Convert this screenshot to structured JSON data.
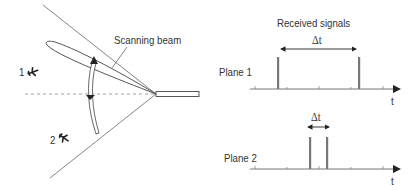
{
  "radar_diagram": {
    "beam_label": "Scanning beam",
    "aircraft": [
      {
        "label": "1",
        "icon": "airplane-icon"
      },
      {
        "label": "2",
        "icon": "airplane-icon"
      }
    ]
  },
  "signals": {
    "title": "Received signals",
    "plots": [
      {
        "label": "Plane 1",
        "delta_label": "Δt",
        "axis_label": "t",
        "pulse_x": [
          278,
          359
        ]
      },
      {
        "label": "Plane 2",
        "delta_label": "Δt",
        "axis_label": "t",
        "pulse_x": [
          310,
          327
        ]
      }
    ]
  },
  "colors": {
    "line": "#555555",
    "pulse": "#777777",
    "text": "#333333"
  }
}
